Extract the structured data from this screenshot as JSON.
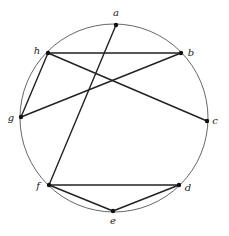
{
  "diagram": {
    "type": "graph-on-circle",
    "circle": {
      "cx": 114,
      "cy": 118,
      "r": 94,
      "stroke": "#555555"
    },
    "vertices": [
      {
        "id": "a",
        "label": "a",
        "x": 116,
        "y": 25,
        "lx": 116,
        "ly": 16
      },
      {
        "id": "b",
        "label": "b",
        "x": 181,
        "y": 53,
        "lx": 191,
        "ly": 56
      },
      {
        "id": "c",
        "label": "c",
        "x": 207,
        "y": 121,
        "lx": 215,
        "ly": 124
      },
      {
        "id": "d",
        "label": "d",
        "x": 179,
        "y": 185,
        "lx": 188,
        "ly": 191
      },
      {
        "id": "e",
        "label": "e",
        "x": 113,
        "y": 211,
        "lx": 113,
        "ly": 224
      },
      {
        "id": "f",
        "label": "f",
        "x": 49,
        "y": 185,
        "lx": 38,
        "ly": 189
      },
      {
        "id": "g",
        "label": "g",
        "x": 21,
        "y": 117,
        "lx": 11,
        "ly": 121
      },
      {
        "id": "h",
        "label": "h",
        "x": 48,
        "y": 53,
        "lx": 37,
        "ly": 54
      }
    ],
    "edges": [
      {
        "from": "h",
        "to": "b"
      },
      {
        "from": "h",
        "to": "c"
      },
      {
        "from": "h",
        "to": "g"
      },
      {
        "from": "g",
        "to": "b"
      },
      {
        "from": "a",
        "to": "f"
      },
      {
        "from": "f",
        "to": "d"
      },
      {
        "from": "f",
        "to": "e"
      },
      {
        "from": "e",
        "to": "d"
      }
    ],
    "edge_color": "#222222",
    "vertex_color": "#111111"
  }
}
